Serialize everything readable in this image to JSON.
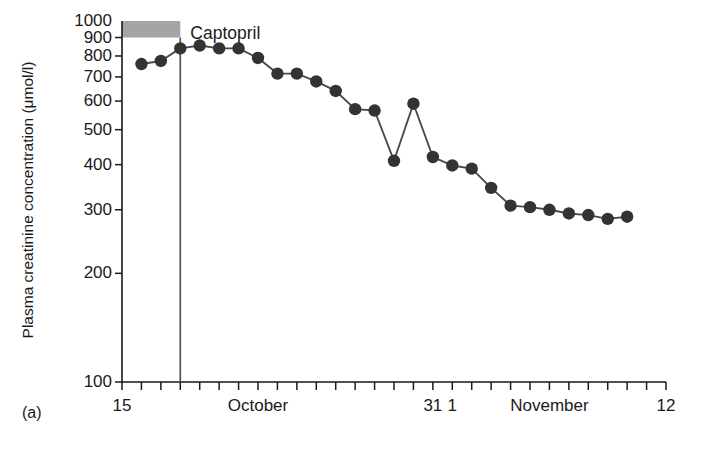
{
  "figure": {
    "panel_label": "(a)",
    "annotation_label": "Captopril",
    "annotation_line_date": 18,
    "treatment_bar": {
      "name": "treatment-period-bar",
      "color": "#8c8c8c",
      "y_from": 900,
      "y_to": 1000,
      "x_from": 15,
      "x_to": 18
    },
    "marker_color": "#333333",
    "line_color": "#4a4a4a",
    "axis_color": "#1a1a1a"
  },
  "chart_data": {
    "type": "line",
    "title": "",
    "xlabel": "",
    "ylabel": "Plasma creatinine concentration (μmol/l)",
    "yscale": "log",
    "ylim": [
      100,
      1000
    ],
    "yticks": [
      100,
      200,
      300,
      400,
      500,
      600,
      700,
      800,
      900,
      1000
    ],
    "ytick_labels": [
      "100",
      "200",
      "300",
      "400",
      "500",
      "600",
      "700",
      "800",
      "900",
      "1000"
    ],
    "xlim": [
      15,
      43
    ],
    "x_tick_step": 1,
    "x_tick_count": 29,
    "xtick_labels": [
      {
        "x": 15,
        "text": "15"
      },
      {
        "x": 22,
        "text": "October"
      },
      {
        "x": 31,
        "text": "31"
      },
      {
        "x": 32,
        "text": "1"
      },
      {
        "x": 37,
        "text": "November"
      },
      {
        "x": 43,
        "text": "12"
      }
    ],
    "grid": false,
    "legend": "none",
    "series": [
      {
        "name": "plasma-creatinine",
        "x": [
          16,
          17,
          18,
          19,
          20,
          21,
          22,
          23,
          24,
          25,
          26,
          27,
          28,
          29,
          30,
          31,
          32,
          33,
          34,
          35,
          36,
          37,
          38,
          39,
          40,
          41
        ],
        "values": [
          760,
          775,
          840,
          855,
          840,
          840,
          790,
          715,
          715,
          680,
          640,
          570,
          565,
          410,
          590,
          420,
          398,
          390,
          345,
          308,
          305,
          300,
          293,
          290,
          283,
          287
        ]
      }
    ]
  }
}
